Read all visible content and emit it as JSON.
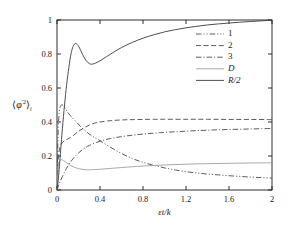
{
  "chart_data": {
    "type": "line",
    "title": "",
    "xlabel": "εt/k",
    "ylabel_parts": {
      "open": "⟨",
      "phi": "φ",
      "prime_sq": "′2",
      "close": "⟩",
      "sub": "i"
    },
    "ylabel_plain": "⟨φ′2⟩i",
    "xlim": [
      0,
      2
    ],
    "ylim": [
      0,
      1
    ],
    "xticks": [
      "0",
      "0.4",
      "0.8",
      "1.2",
      "1.6",
      "2"
    ],
    "xtick_values": [
      0,
      0.4,
      0.8,
      1.2,
      1.6,
      2
    ],
    "yticks": [
      "0",
      "0.2",
      "0.4",
      "0.6",
      "0.8",
      "1"
    ],
    "ytick_values": [
      0,
      0.2,
      0.4,
      0.6,
      0.8,
      1
    ],
    "grid": false,
    "legend_position": "upper-right-inside",
    "axis_color": "#1a1a1a",
    "series": [
      {
        "name": "1",
        "label": "1",
        "style": "dash-dot-dot",
        "color": "#4a4a4a",
        "x": [
          0,
          0.01,
          0.02,
          0.03,
          0.05,
          0.08,
          0.12,
          0.18,
          0.25,
          0.32,
          0.4,
          0.5,
          0.6,
          0.7,
          0.8,
          0.9,
          1.0,
          1.1,
          1.2,
          1.3,
          1.4,
          1.5,
          1.6,
          1.7,
          1.8,
          1.9,
          2.0
        ],
        "values": [
          0.0,
          0.33,
          0.45,
          0.49,
          0.5,
          0.475,
          0.44,
          0.4,
          0.355,
          0.32,
          0.29,
          0.25,
          0.215,
          0.185,
          0.163,
          0.145,
          0.13,
          0.118,
          0.108,
          0.1,
          0.094,
          0.089,
          0.084,
          0.08,
          0.076,
          0.073,
          0.07
        ]
      },
      {
        "name": "2",
        "label": "2",
        "style": "dashed",
        "color": "#4a4a4a",
        "x": [
          0,
          0.01,
          0.02,
          0.04,
          0.07,
          0.1,
          0.15,
          0.2,
          0.25,
          0.3,
          0.35,
          0.4,
          0.5,
          0.6,
          0.7,
          0.8,
          0.9,
          1.0,
          1.2,
          1.4,
          1.6,
          1.8,
          2.0
        ],
        "values": [
          0.0,
          0.16,
          0.23,
          0.27,
          0.29,
          0.3,
          0.32,
          0.345,
          0.365,
          0.382,
          0.393,
          0.4,
          0.408,
          0.412,
          0.414,
          0.415,
          0.416,
          0.416,
          0.416,
          0.416,
          0.415,
          0.415,
          0.414
        ]
      },
      {
        "name": "3",
        "label": "3",
        "style": "dash-dot",
        "color": "#4a4a4a",
        "x": [
          0,
          0.02,
          0.04,
          0.07,
          0.1,
          0.15,
          0.2,
          0.25,
          0.3,
          0.4,
          0.5,
          0.6,
          0.7,
          0.8,
          0.9,
          1.0,
          1.2,
          1.4,
          1.6,
          1.8,
          2.0
        ],
        "values": [
          0.0,
          0.035,
          0.065,
          0.105,
          0.14,
          0.185,
          0.218,
          0.243,
          0.262,
          0.287,
          0.303,
          0.314,
          0.322,
          0.329,
          0.334,
          0.339,
          0.346,
          0.352,
          0.356,
          0.359,
          0.362
        ]
      },
      {
        "name": "D",
        "label": "D",
        "style": "solid-light",
        "color": "#9a9a9a",
        "x": [
          0,
          0.01,
          0.02,
          0.04,
          0.06,
          0.09,
          0.12,
          0.16,
          0.2,
          0.25,
          0.3,
          0.4,
          0.5,
          0.6,
          0.8,
          1.0,
          1.2,
          1.4,
          1.6,
          1.8,
          2.0
        ],
        "values": [
          0.0,
          0.12,
          0.165,
          0.178,
          0.173,
          0.16,
          0.147,
          0.134,
          0.126,
          0.12,
          0.119,
          0.122,
          0.127,
          0.132,
          0.141,
          0.147,
          0.152,
          0.155,
          0.157,
          0.159,
          0.16
        ]
      },
      {
        "name": "R/2",
        "label": "R/2",
        "style": "solid",
        "color": "#3a3a3a",
        "x": [
          0,
          0.01,
          0.02,
          0.03,
          0.05,
          0.07,
          0.09,
          0.11,
          0.13,
          0.15,
          0.17,
          0.19,
          0.21,
          0.24,
          0.27,
          0.3,
          0.32,
          0.35,
          0.4,
          0.45,
          0.5,
          0.6,
          0.7,
          0.8,
          0.9,
          1.0,
          1.1,
          1.2,
          1.3,
          1.4,
          1.5,
          1.6,
          1.7,
          1.8,
          1.9,
          2.0
        ],
        "values": [
          0.0,
          0.05,
          0.12,
          0.2,
          0.36,
          0.5,
          0.62,
          0.72,
          0.8,
          0.845,
          0.861,
          0.855,
          0.835,
          0.795,
          0.762,
          0.744,
          0.74,
          0.744,
          0.76,
          0.78,
          0.8,
          0.838,
          0.868,
          0.893,
          0.913,
          0.93,
          0.943,
          0.954,
          0.963,
          0.971,
          0.977,
          0.982,
          0.987,
          0.991,
          0.995,
          0.999
        ]
      }
    ]
  },
  "plot_geometry": {
    "left": 57,
    "right": 272,
    "top": 20,
    "bottom": 190
  },
  "legend": {
    "entries": [
      {
        "label": "1",
        "italic": false
      },
      {
        "label": "2",
        "italic": false
      },
      {
        "label": "3",
        "italic": false
      },
      {
        "label": "D",
        "italic": true
      },
      {
        "label": "R/2",
        "italic": true
      }
    ]
  }
}
